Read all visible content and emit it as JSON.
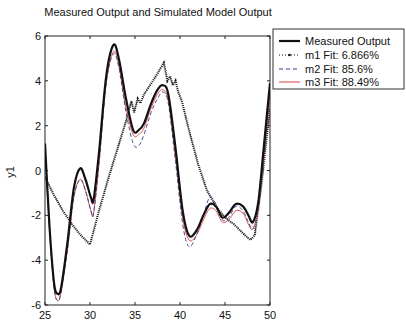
{
  "chart_data": {
    "type": "line",
    "title": "Measured Output and Simulated Model Output",
    "xlabel": "",
    "ylabel": "y1",
    "xlim": [
      25,
      50
    ],
    "ylim": [
      -6,
      6
    ],
    "xticks": [
      25,
      30,
      35,
      40,
      45,
      50
    ],
    "yticks": [
      -6,
      -4,
      -2,
      0,
      2,
      4,
      6
    ],
    "grid": false,
    "legend_position": "outside-right-top",
    "series": [
      {
        "name": "Measured Output",
        "style": "solid-thick",
        "color": "#111111",
        "x": [
          25,
          25.5,
          26,
          26.4,
          26.8,
          27.5,
          28.2,
          28.9,
          29.5,
          30.1,
          30.4,
          31,
          31.8,
          32.6,
          33.2,
          34,
          34.8,
          35.4,
          36,
          36.8,
          37.5,
          38.1,
          38.7,
          39.5,
          40.3,
          41,
          41.8,
          42.6,
          43.3,
          44,
          44.7,
          45.4,
          46.2,
          47,
          47.6,
          48.1,
          48.7,
          49.3,
          50
        ],
        "values": [
          1.2,
          -2.5,
          -5.0,
          -5.5,
          -5.2,
          -3.2,
          -0.8,
          0.1,
          -0.4,
          -1.2,
          -1.3,
          0.8,
          4.2,
          5.6,
          5.0,
          3.2,
          1.8,
          1.8,
          2.1,
          3.0,
          3.6,
          3.8,
          3.4,
          1.0,
          -1.8,
          -2.9,
          -2.7,
          -2.0,
          -1.5,
          -1.6,
          -2.1,
          -1.9,
          -1.5,
          -1.6,
          -2.0,
          -2.3,
          -1.4,
          1.0,
          3.9
        ]
      },
      {
        "name": "m1 Fit: 6.866%",
        "style": "dotted-marker",
        "color": "#111111",
        "x": [
          25,
          26,
          27,
          28,
          29,
          30,
          31,
          32,
          33,
          34,
          34.6,
          34.9,
          35.3,
          35.6,
          36,
          37,
          38.2,
          38.6,
          38.9,
          39.2,
          39.5,
          39.8,
          40.2,
          41,
          42,
          43,
          44,
          45,
          46,
          47,
          47.8,
          48.3,
          49,
          50
        ],
        "values": [
          -0.3,
          -1.1,
          -1.8,
          -2.4,
          -2.9,
          -3.3,
          -1.8,
          -0.4,
          0.9,
          2.2,
          3.1,
          2.6,
          3.2,
          3.0,
          3.4,
          4.0,
          4.8,
          4.0,
          4.2,
          3.8,
          4.0,
          3.5,
          3.1,
          1.8,
          0.3,
          -0.9,
          -1.6,
          -2.1,
          -2.4,
          -2.8,
          -3.1,
          -2.9,
          -0.8,
          2.8
        ]
      },
      {
        "name": "m2 Fit: 85.6%",
        "style": "dashed",
        "color": "#3a3a8c",
        "x": [
          25,
          25.5,
          26,
          26.4,
          26.8,
          27.5,
          28.2,
          28.9,
          29.5,
          30.1,
          30.4,
          31,
          31.8,
          32.6,
          33.2,
          34,
          34.8,
          35.4,
          36,
          36.8,
          37.5,
          38.1,
          38.7,
          39.5,
          40.3,
          41,
          41.8,
          42.6,
          43.3,
          44,
          44.7,
          45.4,
          46.2,
          47,
          47.6,
          48.1,
          48.7,
          49.3,
          50
        ],
        "values": [
          1.0,
          -2.6,
          -5.2,
          -5.8,
          -5.4,
          -3.5,
          -1.2,
          -0.4,
          -0.9,
          -1.8,
          -1.9,
          0.3,
          3.9,
          5.2,
          4.6,
          2.6,
          1.2,
          1.1,
          1.6,
          2.6,
          3.2,
          3.5,
          3.0,
          0.4,
          -2.4,
          -3.4,
          -2.9,
          -2.0,
          -1.2,
          -1.5,
          -2.2,
          -2.1,
          -1.6,
          -1.8,
          -2.3,
          -2.6,
          -1.7,
          0.6,
          3.4
        ]
      },
      {
        "name": "m3 Fit: 88.49%",
        "style": "solid-thin",
        "color": "#d9413e",
        "x": [
          25,
          25.5,
          26,
          26.4,
          26.8,
          27.5,
          28.2,
          28.9,
          29.5,
          30.1,
          30.4,
          31,
          31.8,
          32.6,
          33.2,
          34,
          34.8,
          35.4,
          36,
          36.8,
          37.5,
          38.1,
          38.7,
          39.5,
          40.3,
          41,
          41.8,
          42.6,
          43.3,
          44,
          44.7,
          45.4,
          46.2,
          47,
          47.6,
          48.1,
          48.7,
          49.3,
          50
        ],
        "values": [
          1.0,
          -2.6,
          -5.2,
          -5.8,
          -5.4,
          -3.5,
          -1.2,
          -0.4,
          -0.9,
          -1.8,
          -1.9,
          0.3,
          3.9,
          5.3,
          4.7,
          2.8,
          1.6,
          1.6,
          1.9,
          2.8,
          3.4,
          3.6,
          3.1,
          0.6,
          -2.1,
          -3.1,
          -2.9,
          -2.2,
          -1.7,
          -1.8,
          -2.3,
          -2.2,
          -1.8,
          -1.9,
          -2.4,
          -2.6,
          -1.7,
          0.6,
          3.4
        ]
      }
    ]
  },
  "title": "Measured Output and Simulated Model Output",
  "ylabel": "y1",
  "legend": {
    "items": [
      {
        "label": "Measured Output"
      },
      {
        "label": "m1 Fit: 6.866%"
      },
      {
        "label": "m2 Fit: 85.6%"
      },
      {
        "label": "m3 Fit: 88.49%"
      }
    ]
  },
  "axes": {
    "xticks": [
      "25",
      "30",
      "35",
      "40",
      "45",
      "50"
    ],
    "yticks": [
      "6",
      "4",
      "2",
      "0",
      "-2",
      "-4",
      "-6"
    ]
  }
}
